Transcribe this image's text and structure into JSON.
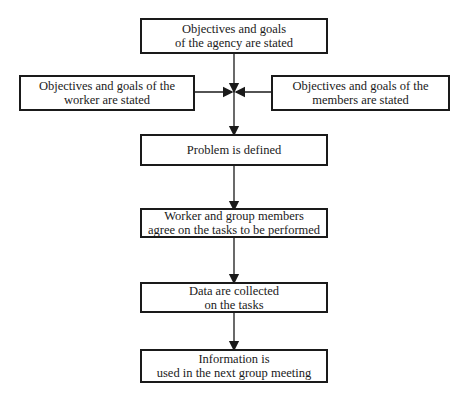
{
  "diagram": {
    "nodes": [
      {
        "id": "agency",
        "lines": [
          "Objectives and goals",
          "of the agency are stated"
        ]
      },
      {
        "id": "worker",
        "lines": [
          "Objectives and goals of the",
          "worker are stated"
        ]
      },
      {
        "id": "members",
        "lines": [
          "Objectives and goals of the",
          "members are stated"
        ]
      },
      {
        "id": "problem",
        "lines": [
          "Problem is defined"
        ]
      },
      {
        "id": "agree",
        "lines": [
          "Worker and group members",
          "agree on the tasks to be performed"
        ]
      },
      {
        "id": "data",
        "lines": [
          "Data are collected",
          "on the tasks"
        ]
      },
      {
        "id": "info",
        "lines": [
          "Information is",
          "used in the next group meeting"
        ]
      }
    ],
    "edges": [
      {
        "from": "agency",
        "to": "problem"
      },
      {
        "from": "worker",
        "to": "problem"
      },
      {
        "from": "members",
        "to": "problem"
      },
      {
        "from": "problem",
        "to": "agree"
      },
      {
        "from": "agree",
        "to": "data"
      },
      {
        "from": "data",
        "to": "info"
      }
    ]
  }
}
